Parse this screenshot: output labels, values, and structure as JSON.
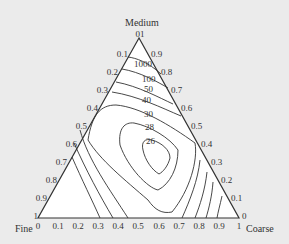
{
  "diagram": {
    "type": "ternary-contour",
    "vertices": {
      "top": "Medium",
      "bottom_left": "Fine",
      "bottom_right": "Coarse"
    },
    "axes": {
      "left_edge_ticks": [
        "0",
        "0.1",
        "0.2",
        "0.3",
        "0.4",
        "0.5",
        "0.6",
        "0.7",
        "0.8",
        "0.9",
        "1"
      ],
      "right_edge_ticks": [
        "1",
        "0.9",
        "0.8",
        "0.7",
        "0.6",
        "0.5",
        "0.4",
        "0.3",
        "0.2",
        "0.1",
        "0"
      ],
      "bottom_edge_ticks": [
        "0",
        "0.1",
        "0.2",
        "0.3",
        "0.4",
        "0.5",
        "0.6",
        "0.7",
        "0.8",
        "0.9",
        "1"
      ]
    },
    "contour_levels": [
      "1000",
      "100",
      "50",
      "40",
      "30",
      "28",
      "26"
    ],
    "colors": {
      "background": "#ebebeb",
      "triangle_fill": "#ffffff",
      "line": "#333333",
      "text": "#333333"
    }
  }
}
